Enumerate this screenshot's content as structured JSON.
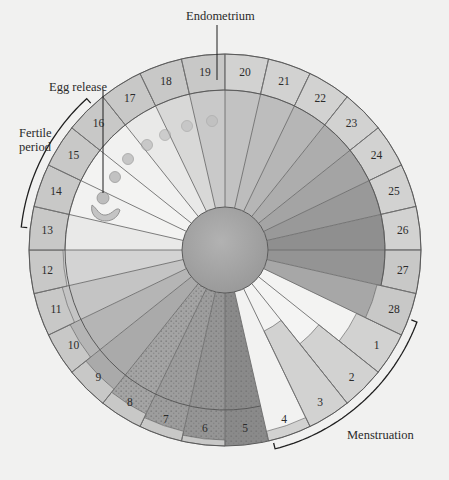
{
  "diagram": {
    "title_labels": {
      "endometrium": "Endometrium",
      "egg_release": "Egg release",
      "fertile_period_line1": "Fertile",
      "fertile_period_line2": "period",
      "menstruation": "Menstruation"
    },
    "geometry": {
      "cx": 225,
      "cy": 250,
      "outer_r": 196,
      "ring_inner_r": 160,
      "hub_r": 43,
      "days_total": 28,
      "first_day_at_top": 20
    },
    "days": [
      {
        "day": 1,
        "inner_fill": "#f3f3f2",
        "ring_inner_r": 146
      },
      {
        "day": 2,
        "inner_fill": "#f4f4f3",
        "ring_inner_r": 120
      },
      {
        "day": 3,
        "inner_fill": "#f3f3f2",
        "ring_inner_r": 90
      },
      {
        "day": 4,
        "inner_fill": "#f2f2f1",
        "ring_inner_r": 186
      },
      {
        "day": 5,
        "inner_fill": "#8a8a8a",
        "ring_inner_r": 196,
        "texture": "stipple"
      },
      {
        "day": 6,
        "inner_fill": "#959595",
        "ring_inner_r": 190,
        "texture": "stipple"
      },
      {
        "day": 7,
        "inner_fill": "#9d9d9d",
        "ring_inner_r": 186,
        "texture": "stipple"
      },
      {
        "day": 8,
        "inner_fill": "#a4a4a4",
        "ring_inner_r": 182,
        "texture": "stipple"
      },
      {
        "day": 9,
        "inner_fill": "#aaaaaa",
        "ring_inner_r": 178
      },
      {
        "day": 10,
        "inner_fill": "#b5b5b5",
        "ring_inner_r": 172
      },
      {
        "day": 11,
        "inner_fill": "#c4c4c4",
        "ring_inner_r": 167
      },
      {
        "day": 12,
        "inner_fill": "#d3d3d3",
        "ring_inner_r": 162
      },
      {
        "day": 13,
        "inner_fill": "#e9e9e8",
        "ring_inner_r": 160
      },
      {
        "day": 14,
        "inner_fill": "#f2f2f1",
        "ring_inner_r": 160
      },
      {
        "day": 15,
        "inner_fill": "#f3f3f2",
        "ring_inner_r": 160
      },
      {
        "day": 16,
        "inner_fill": "#f1f1f0",
        "ring_inner_r": 160
      },
      {
        "day": 17,
        "inner_fill": "#e9e9e8",
        "ring_inner_r": 160
      },
      {
        "day": 18,
        "inner_fill": "#d8d8d7",
        "ring_inner_r": 160
      },
      {
        "day": 19,
        "inner_fill": "#c9c9c9",
        "ring_inner_r": 160
      },
      {
        "day": 20,
        "inner_fill": "#c2c2c2",
        "ring_inner_r": 160
      },
      {
        "day": 21,
        "inner_fill": "#bdbdbd",
        "ring_inner_r": 160
      },
      {
        "day": 22,
        "inner_fill": "#b6b6b6",
        "ring_inner_r": 160
      },
      {
        "day": 23,
        "inner_fill": "#adadad",
        "ring_inner_r": 160
      },
      {
        "day": 24,
        "inner_fill": "#a4a4a4",
        "ring_inner_r": 160
      },
      {
        "day": 25,
        "inner_fill": "#999999",
        "ring_inner_r": 160
      },
      {
        "day": 26,
        "inner_fill": "#8f8f8f",
        "ring_inner_r": 160
      },
      {
        "day": 27,
        "inner_fill": "#949494",
        "ring_inner_r": 160
      },
      {
        "day": 28,
        "inner_fill": "#a7a7a7",
        "ring_inner_r": 156
      }
    ],
    "colors": {
      "background": "#f1f1f0",
      "ring_fill": "#c8c8c7",
      "ring_fill_light": "#d2d2d1",
      "spoke": "#6e6e6e",
      "outline": "#5a5a5a",
      "hub_fill": "#a6a6a6",
      "text": "#2a2a2a",
      "bracket": "#1f1f1f",
      "egg": "#b8b8b8"
    },
    "egg_path": [
      {
        "x": 103,
        "y": 198,
        "r": 6
      },
      {
        "x": 115,
        "y": 177,
        "r": 5.5
      },
      {
        "x": 128,
        "y": 159,
        "r": 5.5
      },
      {
        "x": 147,
        "y": 145,
        "r": 5.5
      },
      {
        "x": 165,
        "y": 135,
        "r": 5.5
      },
      {
        "x": 187,
        "y": 126,
        "r": 5.5
      },
      {
        "x": 212,
        "y": 121,
        "r": 5.5
      }
    ],
    "fertile_bracket": {
      "start_day": 13.5,
      "end_day": 16.7
    },
    "menstruation_bracket": {
      "start_day": 0.6,
      "end_day": 4.9
    }
  }
}
